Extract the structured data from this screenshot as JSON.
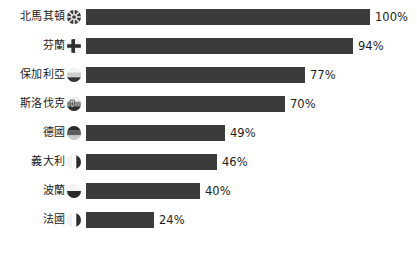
{
  "chart_data": {
    "type": "bar",
    "orientation": "horizontal",
    "title": "",
    "subtitle": "",
    "xlabel": "",
    "ylabel": "",
    "xlim": [
      0,
      100
    ],
    "grid": false,
    "legend": null,
    "value_suffix": "%",
    "categories": [
      "北馬其頓",
      "芬蘭",
      "保加利亞",
      "斯洛伐克",
      "德國",
      "義大利",
      "波蘭",
      "法國"
    ],
    "values": [
      100,
      94,
      77,
      70,
      49,
      46,
      40,
      24
    ],
    "value_labels": [
      "100%",
      "94%",
      "77%",
      "70%",
      "49%",
      "46%",
      "40%",
      "24%"
    ],
    "bar_color": "#3b3b3b",
    "background_color": "#ffffff",
    "text_color": "#1e1e1e",
    "items": [
      {
        "label": "北馬其頓",
        "value": 100,
        "value_label": "100%",
        "flag": "flag-north-macedonia-icon"
      },
      {
        "label": "芬蘭",
        "value": 94,
        "value_label": "94%",
        "flag": "flag-finland-icon"
      },
      {
        "label": "保加利亞",
        "value": 77,
        "value_label": "77%",
        "flag": "flag-bulgaria-icon"
      },
      {
        "label": "斯洛伐克",
        "value": 70,
        "value_label": "70%",
        "flag": "flag-slovakia-icon"
      },
      {
        "label": "德國",
        "value": 49,
        "value_label": "49%",
        "flag": "flag-germany-icon"
      },
      {
        "label": "義大利",
        "value": 46,
        "value_label": "46%",
        "flag": "flag-italy-icon"
      },
      {
        "label": "波蘭",
        "value": 40,
        "value_label": "40%",
        "flag": "flag-poland-icon"
      },
      {
        "label": "法國",
        "value": 24,
        "value_label": "24%",
        "flag": "flag-france-icon"
      }
    ]
  },
  "layout": {
    "bar_origin_x": 86,
    "bar_px_per_percent": 2.84,
    "row_height": 16,
    "row_gap": 13,
    "first_row_top": 9,
    "value_gap": 5
  }
}
